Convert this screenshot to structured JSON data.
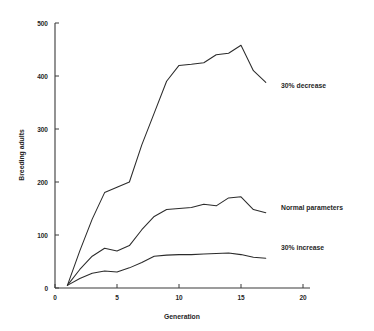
{
  "chart_data": {
    "type": "line",
    "title": "",
    "xlabel": "Generation",
    "ylabel": "Breeding adults",
    "xlim": [
      0,
      20
    ],
    "ylim": [
      0,
      500
    ],
    "xticks": [
      0,
      5,
      10,
      15,
      20
    ],
    "yticks": [
      0,
      100,
      200,
      300,
      400,
      500
    ],
    "grid": false,
    "legend_position": "right-inline-annotations",
    "series": [
      {
        "name": "30% decrease",
        "annotation": "30% decrease",
        "x": [
          1,
          2,
          3,
          4,
          5,
          6,
          7,
          8,
          9,
          10,
          11,
          12,
          13,
          14,
          15,
          16,
          17
        ],
        "values": [
          5,
          70,
          130,
          180,
          190,
          200,
          270,
          330,
          390,
          420,
          422,
          425,
          440,
          443,
          458,
          410,
          388
        ]
      },
      {
        "name": "Normal parameters",
        "annotation": "Normal parameters",
        "x": [
          1,
          2,
          3,
          4,
          5,
          6,
          7,
          8,
          9,
          10,
          11,
          12,
          13,
          14,
          15,
          16,
          17
        ],
        "values": [
          5,
          35,
          60,
          75,
          70,
          80,
          110,
          135,
          148,
          150,
          152,
          158,
          155,
          170,
          172,
          148,
          142
        ]
      },
      {
        "name": "30% increase",
        "annotation": "30% increase",
        "x": [
          1,
          2,
          3,
          4,
          5,
          6,
          7,
          8,
          9,
          10,
          11,
          12,
          13,
          14,
          15,
          16,
          17
        ],
        "values": [
          5,
          18,
          28,
          32,
          30,
          38,
          48,
          60,
          62,
          63,
          63,
          64,
          65,
          66,
          63,
          58,
          56
        ]
      }
    ]
  },
  "labels": {
    "xticks": [
      "0",
      "5",
      "10",
      "15",
      "20"
    ],
    "yticks": [
      "0",
      "100",
      "200",
      "300",
      "400",
      "500"
    ],
    "xlabel": "Generation",
    "ylabel": "Breeding adults",
    "annotations": [
      "30% decrease",
      "Normal parameters",
      "30% increase"
    ]
  },
  "colors": {
    "line": "#2b2b2b",
    "axis": "#3a3a3a",
    "text": "#1f1f1f",
    "background": "#ffffff"
  }
}
